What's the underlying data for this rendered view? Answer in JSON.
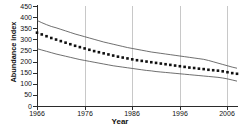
{
  "chart_data": {
    "type": "line",
    "title": "",
    "xlabel": "Year",
    "ylabel": "Abundance index",
    "xlim": [
      1966,
      2008
    ],
    "ylim": [
      0,
      450
    ],
    "grid": "vertical-only",
    "legend": "none",
    "x_ticks": [
      1966,
      1976,
      1986,
      1996,
      2006
    ],
    "x_tick_labels": [
      "1966",
      "1976",
      "1986",
      "1996",
      "2006"
    ],
    "y_ticks": [
      0,
      50,
      100,
      150,
      200,
      250,
      300,
      350,
      400,
      450
    ],
    "y_tick_labels": [
      "0",
      "50",
      "100",
      "150",
      "200",
      "250",
      "300",
      "350",
      "400",
      "450"
    ],
    "x": [
      1966,
      1967,
      1968,
      1969,
      1970,
      1971,
      1972,
      1973,
      1974,
      1975,
      1976,
      1977,
      1978,
      1979,
      1980,
      1981,
      1982,
      1983,
      1984,
      1985,
      1986,
      1987,
      1988,
      1989,
      1990,
      1991,
      1992,
      1993,
      1994,
      1995,
      1996,
      1997,
      1998,
      1999,
      2000,
      2001,
      2002,
      2003,
      2004,
      2005,
      2006,
      2007,
      2008
    ],
    "series": [
      {
        "name": "Upper confidence limit",
        "style": "solid-line",
        "values": [
          385,
          375,
          366,
          358,
          352,
          345,
          338,
          331,
          324,
          318,
          312,
          306,
          300,
          294,
          288,
          283,
          278,
          273,
          268,
          263,
          259,
          255,
          251,
          247,
          243,
          240,
          237,
          234,
          231,
          228,
          225,
          222,
          219,
          216,
          213,
          210,
          205,
          199,
          193,
          187,
          181,
          175,
          170
        ]
      },
      {
        "name": "Abundance index (estimate)",
        "style": "dotted-markers",
        "values": [
          330,
          322,
          314,
          306,
          299,
          292,
          285,
          278,
          271,
          265,
          259,
          253,
          247,
          242,
          237,
          232,
          227,
          222,
          218,
          214,
          210,
          206,
          203,
          200,
          197,
          194,
          191,
          188,
          185,
          182,
          179,
          176,
          173,
          171,
          168,
          166,
          163,
          161,
          159,
          156,
          152,
          148,
          145
        ]
      },
      {
        "name": "Lower confidence limit",
        "style": "solid-line",
        "values": [
          258,
          252,
          246,
          240,
          234,
          229,
          224,
          219,
          214,
          209,
          205,
          201,
          197,
          193,
          189,
          185,
          181,
          178,
          175,
          172,
          169,
          166,
          163,
          160,
          158,
          155,
          153,
          151,
          149,
          147,
          145,
          143,
          141,
          139,
          137,
          135,
          133,
          131,
          129,
          126,
          122,
          117,
          112
        ]
      }
    ]
  }
}
